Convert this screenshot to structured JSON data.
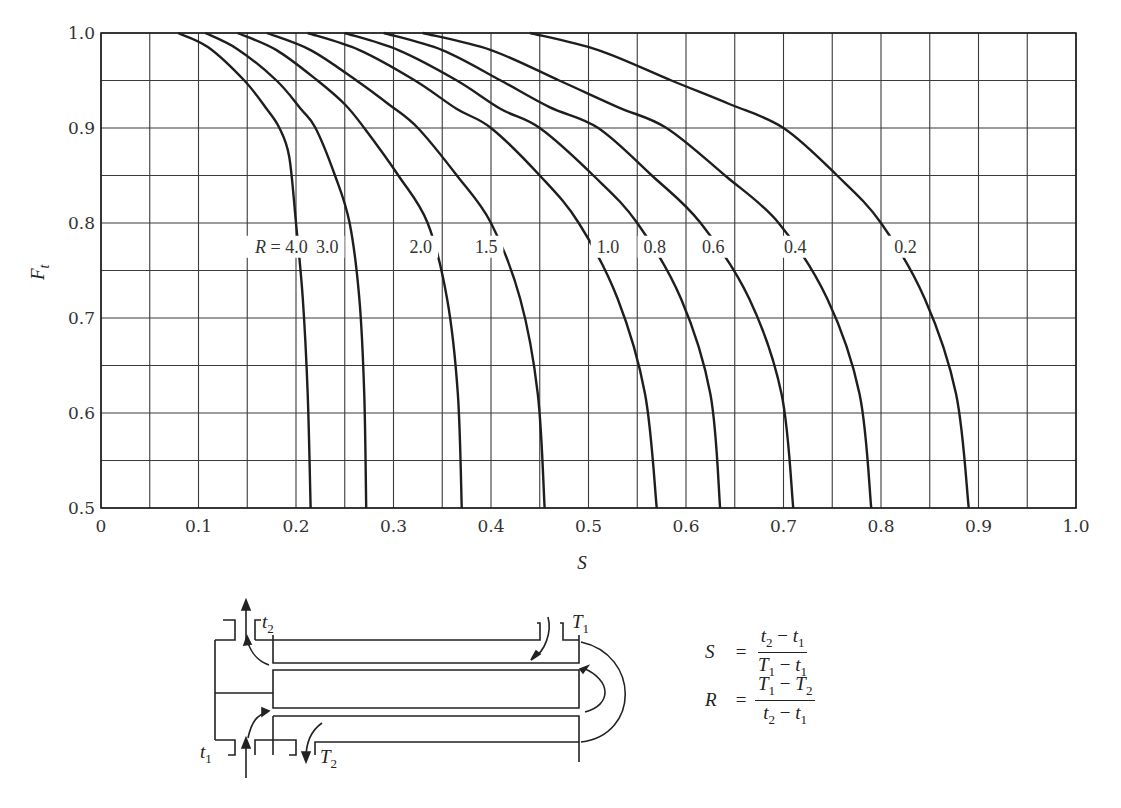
{
  "chart_data": {
    "type": "line",
    "title": "",
    "xlabel": "S",
    "ylabel": "F_t",
    "xlim": [
      0,
      1.0
    ],
    "ylim": [
      0.5,
      1.0
    ],
    "grid": true,
    "grid_step_x": 0.05,
    "grid_step_y": 0.05,
    "x_ticks": [
      "0",
      "0.1",
      "0.2",
      "0.3",
      "0.4",
      "0.5",
      "0.6",
      "0.7",
      "0.8",
      "0.9",
      "1.0"
    ],
    "y_ticks": [
      "0.5",
      "0.6",
      "0.7",
      "0.8",
      "0.9",
      "1.0"
    ],
    "legend": "inline labels along F = 0.775 line",
    "label_prefix": "R = ",
    "series": [
      {
        "name": "4.0",
        "label": "4.0",
        "label_s": 0.185,
        "points": [
          [
            0.079,
            1.0
          ],
          [
            0.11,
            0.985
          ],
          [
            0.147,
            0.95
          ],
          [
            0.17,
            0.92
          ],
          [
            0.183,
            0.9
          ],
          [
            0.193,
            0.87
          ],
          [
            0.2,
            0.8
          ],
          [
            0.207,
            0.72
          ],
          [
            0.212,
            0.62
          ],
          [
            0.215,
            0.5
          ]
        ]
      },
      {
        "name": "3.0",
        "label": "3.0",
        "label_s": 0.232,
        "points": [
          [
            0.107,
            1.0
          ],
          [
            0.14,
            0.983
          ],
          [
            0.18,
            0.95
          ],
          [
            0.205,
            0.92
          ],
          [
            0.22,
            0.9
          ],
          [
            0.24,
            0.85
          ],
          [
            0.255,
            0.8
          ],
          [
            0.265,
            0.72
          ],
          [
            0.27,
            0.62
          ],
          [
            0.272,
            0.5
          ]
        ]
      },
      {
        "name": "2.0",
        "label": "2.0",
        "label_s": 0.328,
        "points": [
          [
            0.14,
            1.0
          ],
          [
            0.18,
            0.982
          ],
          [
            0.222,
            0.95
          ],
          [
            0.25,
            0.925
          ],
          [
            0.27,
            0.9
          ],
          [
            0.305,
            0.85
          ],
          [
            0.335,
            0.8
          ],
          [
            0.355,
            0.72
          ],
          [
            0.366,
            0.62
          ],
          [
            0.37,
            0.5
          ]
        ]
      },
      {
        "name": "1.5",
        "label": "1.5",
        "label_s": 0.395,
        "points": [
          [
            0.17,
            1.0
          ],
          [
            0.215,
            0.982
          ],
          [
            0.262,
            0.95
          ],
          [
            0.295,
            0.925
          ],
          [
            0.325,
            0.9
          ],
          [
            0.365,
            0.85
          ],
          [
            0.4,
            0.8
          ],
          [
            0.43,
            0.72
          ],
          [
            0.448,
            0.62
          ],
          [
            0.455,
            0.5
          ]
        ]
      },
      {
        "name": "1.0",
        "label": "1.0",
        "label_s": 0.52,
        "points": [
          [
            0.212,
            1.0
          ],
          [
            0.265,
            0.982
          ],
          [
            0.322,
            0.95
          ],
          [
            0.365,
            0.92
          ],
          [
            0.4,
            0.9
          ],
          [
            0.45,
            0.85
          ],
          [
            0.49,
            0.8
          ],
          [
            0.53,
            0.72
          ],
          [
            0.558,
            0.62
          ],
          [
            0.57,
            0.5
          ]
        ]
      },
      {
        "name": "0.8",
        "label": "0.8",
        "label_s": 0.568,
        "points": [
          [
            0.25,
            1.0
          ],
          [
            0.305,
            0.982
          ],
          [
            0.365,
            0.95
          ],
          [
            0.41,
            0.92
          ],
          [
            0.45,
            0.9
          ],
          [
            0.505,
            0.85
          ],
          [
            0.55,
            0.8
          ],
          [
            0.595,
            0.72
          ],
          [
            0.625,
            0.62
          ],
          [
            0.635,
            0.5
          ]
        ]
      },
      {
        "name": "0.6",
        "label": "0.6",
        "label_s": 0.628,
        "points": [
          [
            0.29,
            1.0
          ],
          [
            0.35,
            0.982
          ],
          [
            0.41,
            0.95
          ],
          [
            0.46,
            0.922
          ],
          [
            0.51,
            0.9
          ],
          [
            0.565,
            0.85
          ],
          [
            0.615,
            0.8
          ],
          [
            0.665,
            0.72
          ],
          [
            0.698,
            0.62
          ],
          [
            0.71,
            0.5
          ]
        ]
      },
      {
        "name": "0.4",
        "label": "0.4",
        "label_s": 0.712,
        "points": [
          [
            0.33,
            1.0
          ],
          [
            0.4,
            0.982
          ],
          [
            0.47,
            0.95
          ],
          [
            0.53,
            0.922
          ],
          [
            0.58,
            0.9
          ],
          [
            0.64,
            0.85
          ],
          [
            0.695,
            0.8
          ],
          [
            0.745,
            0.72
          ],
          [
            0.778,
            0.62
          ],
          [
            0.79,
            0.5
          ]
        ]
      },
      {
        "name": "0.2",
        "label": "0.2",
        "label_s": 0.825,
        "points": [
          [
            0.44,
            1.0
          ],
          [
            0.51,
            0.982
          ],
          [
            0.585,
            0.95
          ],
          [
            0.645,
            0.925
          ],
          [
            0.7,
            0.9
          ],
          [
            0.755,
            0.85
          ],
          [
            0.8,
            0.8
          ],
          [
            0.845,
            0.72
          ],
          [
            0.877,
            0.62
          ],
          [
            0.89,
            0.5
          ]
        ]
      }
    ]
  },
  "axes": {
    "y_label_main": "F",
    "y_label_sub": "t",
    "x_label": "S"
  },
  "diagram": {
    "labels": {
      "t2": "t",
      "t2_sub": "2",
      "T1": "T",
      "T1_sub": "1",
      "t1": "t",
      "t1_sub": "1",
      "T2": "T",
      "T2_sub": "2"
    }
  },
  "formulas": {
    "S": {
      "lhs": "S",
      "eq": "=",
      "num": [
        {
          "v": "t",
          "s": "2"
        },
        {
          "op": " − "
        },
        {
          "v": "t",
          "s": "1"
        }
      ],
      "den": [
        {
          "v": "T",
          "s": "1"
        },
        {
          "op": " − "
        },
        {
          "v": "t",
          "s": "1"
        }
      ]
    },
    "R": {
      "lhs": "R",
      "eq": "=",
      "num": [
        {
          "v": "T",
          "s": "1"
        },
        {
          "op": " − "
        },
        {
          "v": "T",
          "s": "2"
        }
      ],
      "den": [
        {
          "v": "t",
          "s": "2"
        },
        {
          "op": " − "
        },
        {
          "v": "t",
          "s": "1"
        }
      ]
    }
  },
  "colors": {
    "grid": "#3a3a3a",
    "curve": "#1e1e1e",
    "text": "#2a2a2a",
    "background": "#ffffff"
  }
}
